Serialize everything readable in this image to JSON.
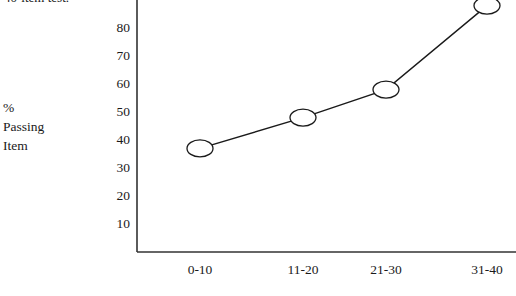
{
  "caption_fragment": "40-item test.",
  "y_axis_title_lines": [
    "%",
    "Passing",
    "Item"
  ],
  "axis": {
    "line_color": "#333333",
    "y_axis_x": 137,
    "x_axis_y": 252,
    "x_axis_right": 516,
    "y_axis_top": 0
  },
  "marker": {
    "stroke": "#1a1a1a",
    "fill": "#ffffff",
    "rx": 13,
    "ry": 8.5
  },
  "line": {
    "stroke": "#1a1a1a",
    "width": 1.4
  },
  "chart_data": {
    "type": "line",
    "title": "",
    "xlabel": "",
    "ylabel": "% Passing Item",
    "categories": [
      "0-10",
      "11-20",
      "21-30",
      "31-40"
    ],
    "values": [
      37,
      48,
      58,
      88
    ],
    "series": [
      {
        "name": "% Passing Item",
        "values": [
          37,
          48,
          58,
          88
        ]
      }
    ],
    "yticks": [
      80,
      70,
      60,
      50,
      40,
      30,
      20,
      10
    ],
    "ylim": [
      0,
      90
    ],
    "grid": false,
    "legend": false,
    "marker_style": "open-ellipse"
  },
  "pixel_map": {
    "y_value_10_px": 224,
    "px_per_unit": 2.8,
    "x_positions": [
      200,
      303,
      386,
      487
    ]
  }
}
